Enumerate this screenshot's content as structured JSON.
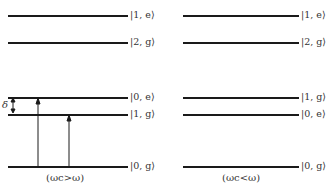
{
  "left_panel": {
    "caption": "(ωc>ω)",
    "levels": [
      {
        "label": "|1, e⟩",
        "y": 15
      },
      {
        "label": "|2, g⟩",
        "y": 42
      },
      {
        "label": "|0, e⟩",
        "y": 97
      },
      {
        "label": "|1, g⟩",
        "y": 114
      },
      {
        "label": "|0, g⟩",
        "y": 166
      }
    ],
    "detuning_label": "δ"
  },
  "right_panel": {
    "caption": "(ωc<ω)",
    "levels": [
      {
        "label": "|1, e⟩",
        "y": 15
      },
      {
        "label": "|2, g⟩",
        "y": 42
      },
      {
        "label": "|1, g⟩",
        "y": 97
      },
      {
        "label": "|0, e⟩",
        "y": 114
      },
      {
        "label": "|0, g⟩",
        "y": 166
      }
    ]
  },
  "colors": {
    "line": "#1a1a1a",
    "text": "#333333"
  }
}
